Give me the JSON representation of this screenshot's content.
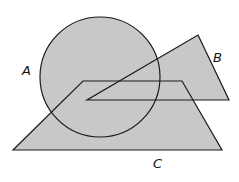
{
  "diagram": {
    "type": "venn-shapes",
    "fill_color": "#c8c8c8",
    "stroke_color": "#1a1a1a",
    "shapes": [
      {
        "id": "A",
        "kind": "circle",
        "label": "A",
        "cx": 100,
        "cy": 77,
        "r": 60,
        "label_pos": [
          22,
          75
        ]
      },
      {
        "id": "B",
        "kind": "triangle",
        "label": "B",
        "points": "198,35 229,100 87,100",
        "label_pos": [
          213,
          62
        ]
      },
      {
        "id": "C",
        "kind": "trapezoid",
        "label": "C",
        "points": "83,81 182,81 222,150 13,150",
        "label_pos": [
          153,
          168
        ]
      }
    ]
  }
}
